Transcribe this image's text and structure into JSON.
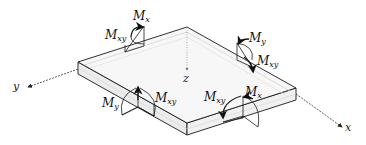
{
  "diagram": {
    "axes": {
      "x": "x",
      "y": "y",
      "z": "z"
    },
    "moments": [
      {
        "id": "back-left-mx",
        "base": "M",
        "sub": "x"
      },
      {
        "id": "back-left-mxy",
        "base": "M",
        "sub": "xy"
      },
      {
        "id": "back-right-my",
        "base": "M",
        "sub": "y"
      },
      {
        "id": "back-right-mxy",
        "base": "M",
        "sub": "xy"
      },
      {
        "id": "front-left-my",
        "base": "M",
        "sub": "y"
      },
      {
        "id": "front-left-mxy",
        "base": "M",
        "sub": "xy"
      },
      {
        "id": "front-right-mxy",
        "base": "M",
        "sub": "xy"
      },
      {
        "id": "front-right-mx",
        "base": "M",
        "sub": "x"
      }
    ],
    "colors": {
      "line": "#1a1a1a",
      "plate_top": "#f6f6f6",
      "plate_side": "#ececec",
      "hatch": "#cfcfcf"
    }
  }
}
